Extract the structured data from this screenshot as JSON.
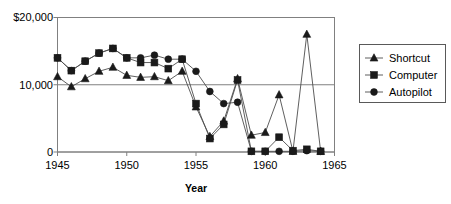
{
  "chart_data": {
    "type": "line",
    "title": "",
    "xlabel": "Year",
    "ylabel": "",
    "xlim": [
      1945,
      1965
    ],
    "ylim": [
      0,
      20000
    ],
    "grid": true,
    "legend_position": "right",
    "x": [
      1945,
      1946,
      1947,
      1948,
      1949,
      1950,
      1951,
      1952,
      1953,
      1954,
      1955,
      1956,
      1957,
      1958,
      1959,
      1960,
      1961,
      1962,
      1963,
      1964
    ],
    "xticks": [
      1945,
      1950,
      1955,
      1960,
      1965
    ],
    "xticklabels": [
      "1945",
      "1950",
      "1955",
      "1960",
      "1965"
    ],
    "yticks": [
      0,
      10000,
      20000
    ],
    "yticklabels": [
      "0",
      "10,000",
      "$20,000"
    ],
    "series": [
      {
        "name": "Shortcut",
        "marker": "triangle",
        "color": "#1a1a1a",
        "values": [
          11200,
          9700,
          10900,
          12000,
          12600,
          11400,
          11100,
          11200,
          10600,
          12000,
          6700,
          2300,
          4600,
          10900,
          2500,
          2900,
          8500,
          100,
          17500,
          100
        ]
      },
      {
        "name": "Computer",
        "marker": "square",
        "color": "#333333",
        "values": [
          14000,
          12100,
          13500,
          14700,
          15400,
          14000,
          13300,
          13300,
          12400,
          13800,
          7200,
          2000,
          4100,
          10700,
          100,
          100,
          2200,
          200,
          400,
          100
        ]
      },
      {
        "name": "Autopilot",
        "marker": "circle",
        "color": "#1a1a1a",
        "values": [
          14000,
          12100,
          13500,
          14700,
          15400,
          14000,
          14000,
          14400,
          13800,
          13800,
          12000,
          9000,
          7200,
          7400,
          100,
          100,
          100,
          100,
          200,
          100
        ]
      }
    ]
  },
  "legend": {
    "entries": [
      {
        "label": "Shortcut",
        "marker": "triangle"
      },
      {
        "label": "Computer",
        "marker": "square"
      },
      {
        "label": "Autopilot",
        "marker": "circle"
      }
    ]
  },
  "axes": {
    "x_title": "Year",
    "y_top_label": "$20,000",
    "y_mid_label": "10,000",
    "y_bottom_label": "0"
  },
  "colors": {
    "background": "#ffffff",
    "frame": "#808080",
    "line": "#4d4d4d",
    "marker": "#1a1a1a",
    "text": "#000000"
  }
}
